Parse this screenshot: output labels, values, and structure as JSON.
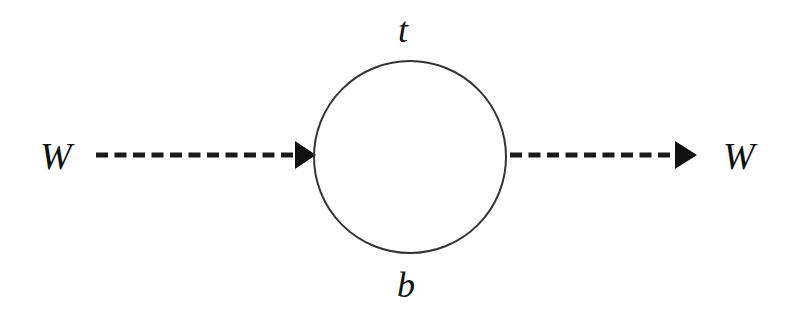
{
  "diagram": {
    "type": "feynman-loop",
    "incoming_label": "W",
    "outgoing_label": "W",
    "top_propagator_label": "t",
    "bottom_propagator_label": "b",
    "line_color": "#222222"
  }
}
